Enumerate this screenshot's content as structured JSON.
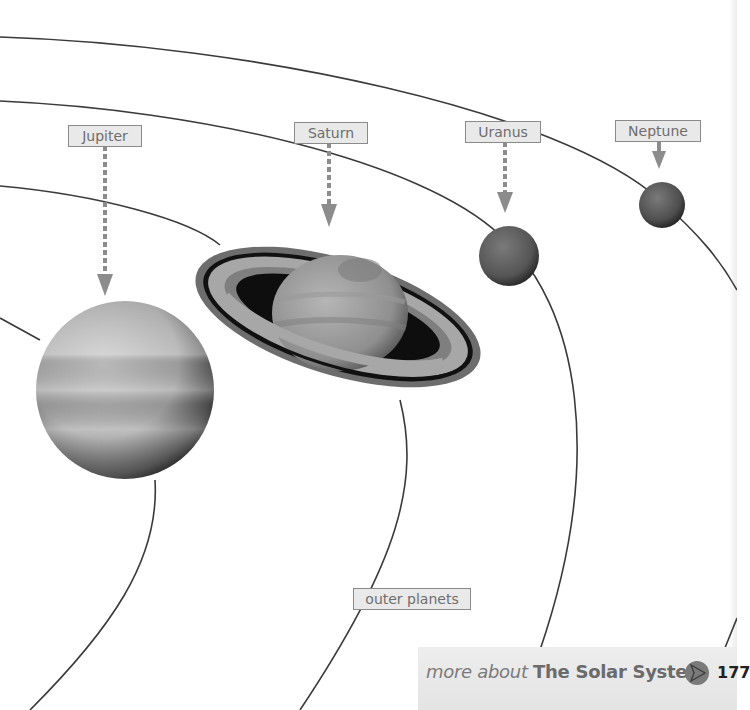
{
  "diagram": {
    "title": "outer planets",
    "planets": [
      {
        "name": "Jupiter"
      },
      {
        "name": "Saturn"
      },
      {
        "name": "Uranus"
      },
      {
        "name": "Neptune"
      }
    ],
    "group_label": "outer planets"
  },
  "labels": {
    "jupiter": "Jupiter",
    "saturn": "Saturn",
    "uranus": "Uranus",
    "neptune": "Neptune",
    "outer_planets": "outer planets"
  },
  "footer": {
    "prefix": "more about",
    "topic": "The Solar System",
    "page_number": "177",
    "icon": "arrow-link-icon"
  },
  "colors": {
    "orbit_line": "#3a3a3a",
    "arrow": "#8c8c8c",
    "label_bg": "#e9e9e9",
    "footer_bg": "#e8e8e8"
  }
}
